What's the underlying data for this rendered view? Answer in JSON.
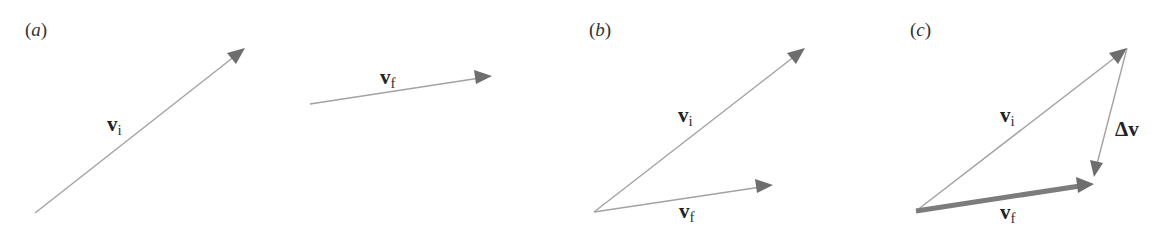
{
  "figure": {
    "panels": [
      {
        "id": "a",
        "label_open": "(",
        "label_letter": "a",
        "label_close": ")",
        "vectors": [
          {
            "name": "v_i",
            "symbol": "v",
            "subscript": "i",
            "from": [
              35,
              213
            ],
            "to": [
              245,
              48
            ],
            "style": "thin"
          },
          {
            "name": "v_f",
            "symbol": "v",
            "subscript": "f",
            "from": [
              310,
              104
            ],
            "to": [
              492,
              76
            ],
            "style": "thin"
          }
        ]
      },
      {
        "id": "b",
        "label_open": "(",
        "label_letter": "b",
        "label_close": ")",
        "vectors": [
          {
            "name": "v_i",
            "symbol": "v",
            "subscript": "i",
            "from": [
              594,
              212
            ],
            "to": [
              805,
              48
            ],
            "style": "thin"
          },
          {
            "name": "v_f",
            "symbol": "v",
            "subscript": "f",
            "from": [
              594,
              212
            ],
            "to": [
              773,
              185
            ],
            "style": "thin"
          }
        ]
      },
      {
        "id": "c",
        "label_open": "(",
        "label_letter": "c",
        "label_close": ")",
        "vectors": [
          {
            "name": "v_i",
            "symbol": "v",
            "subscript": "i",
            "from": [
              916,
              211
            ],
            "to": [
              1127,
              48
            ],
            "style": "thin"
          },
          {
            "name": "v_f",
            "symbol": "v",
            "subscript": "f",
            "from": [
              916,
              211
            ],
            "to": [
              1093,
              184
            ],
            "style": "thick"
          },
          {
            "name": "delta_v",
            "symbol": "Δv",
            "subscript": "",
            "from": [
              1127,
              48
            ],
            "to": [
              1094,
              176
            ],
            "style": "thin"
          }
        ]
      }
    ],
    "colors": {
      "line": "#a2a2a2",
      "thick_line": "#7c7c7c",
      "arrowhead": "#6e6e6e",
      "text": "#222222"
    }
  }
}
